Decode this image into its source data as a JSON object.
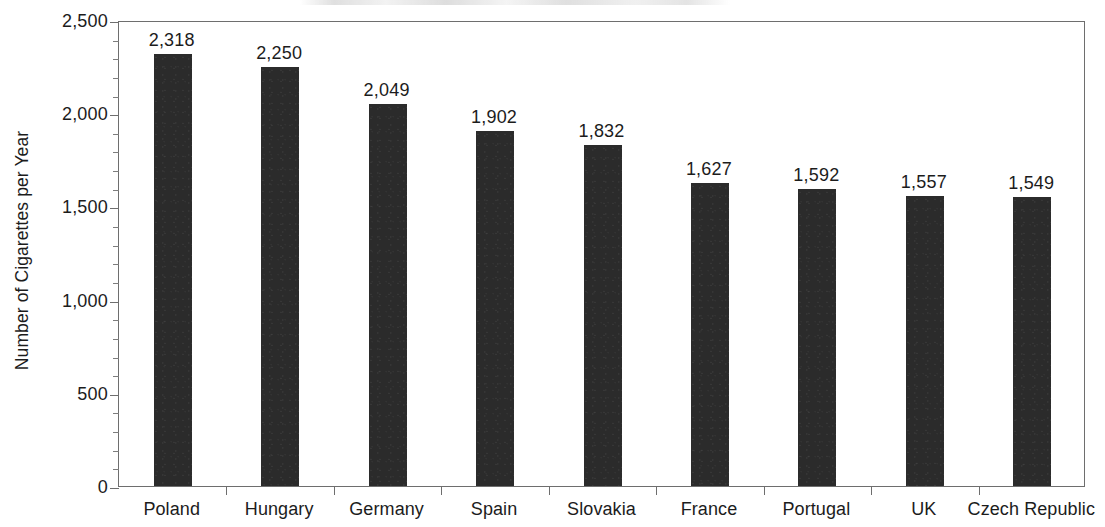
{
  "chart_data": {
    "type": "bar",
    "title": "",
    "xlabel": "",
    "ylabel": "Number of Cigarettes per Year",
    "categories": [
      "Poland",
      "Hungary",
      "Germany",
      "Spain",
      "Slovakia",
      "France",
      "Portugal",
      "UK",
      "Czech Republic"
    ],
    "values": [
      2318,
      2250,
      2049,
      1902,
      1832,
      1627,
      1592,
      1557,
      1549
    ],
    "value_labels": [
      "2,318",
      "2,250",
      "2,049",
      "1,902",
      "1,832",
      "1,627",
      "1,592",
      "1,557",
      "1,549"
    ],
    "ylim": [
      0,
      2500
    ],
    "y_ticks": [
      0,
      500,
      1000,
      1500,
      2000,
      2500
    ],
    "y_tick_labels": [
      "0",
      "500",
      "1,000",
      "1,500",
      "2,000",
      "2,500"
    ],
    "y_minor_tick_step": 100,
    "grid": false,
    "legend": "none",
    "series": [
      {
        "name": "Number of Cigarettes per Year",
        "values": [
          2318,
          2250,
          2049,
          1902,
          1832,
          1627,
          1592,
          1557,
          1549
        ]
      }
    ],
    "bar_color": "#2b2b2b",
    "axis_color": "#6e6e6e",
    "text_color": "#1c1c1c",
    "background_color": "#ffffff"
  }
}
